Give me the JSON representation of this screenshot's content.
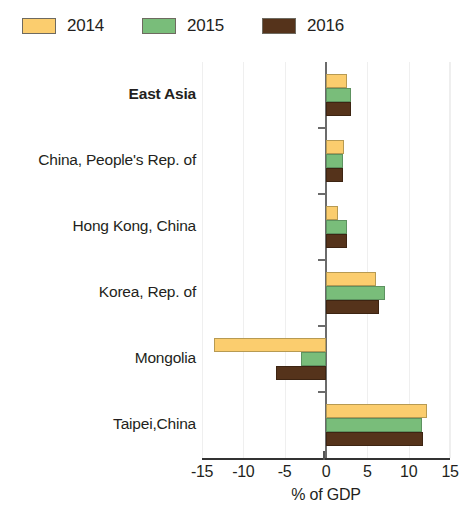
{
  "legend": {
    "items": [
      {
        "label": "2014",
        "color": "#fbcd6e",
        "key": "y2014"
      },
      {
        "label": "2015",
        "color": "#79bd7a",
        "key": "y2015"
      },
      {
        "label": "2016",
        "color": "#55331b",
        "key": "y2016"
      }
    ]
  },
  "chart_data": {
    "type": "bar",
    "orientation": "horizontal",
    "title": "",
    "xlabel": "% of GDP",
    "ylabel": "",
    "xlim": [
      -15,
      15
    ],
    "xticks": [
      -15,
      -10,
      -5,
      0,
      5,
      10,
      15
    ],
    "xtick_labels": [
      "-15",
      "-10",
      "-5",
      "0",
      "5",
      "10",
      "15"
    ],
    "grid": true,
    "legend_position": "top-left",
    "categories": [
      "East Asia",
      "China, People's Rep. of",
      "Hong Kong, China",
      "Korea, Rep. of",
      "Mongolia",
      "Taipei,China"
    ],
    "emphasized_categories": [
      "East Asia"
    ],
    "series": [
      {
        "name": "2014",
        "color": "#fbcd6e",
        "values": [
          2.6,
          2.2,
          1.5,
          6.0,
          -13.5,
          12.2
        ]
      },
      {
        "name": "2015",
        "color": "#79bd7a",
        "values": [
          3.0,
          2.1,
          2.6,
          7.1,
          -3.0,
          11.6
        ]
      },
      {
        "name": "2016",
        "color": "#55331b",
        "values": [
          3.0,
          2.0,
          2.5,
          6.4,
          -6.1,
          11.7
        ]
      }
    ]
  }
}
